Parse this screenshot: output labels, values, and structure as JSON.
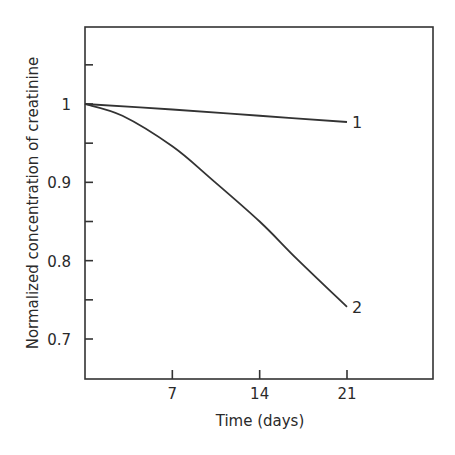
{
  "chart_data": {
    "type": "line",
    "title": "",
    "xlabel": "Time (days)",
    "ylabel": "Normalized concentration of creatinine",
    "xlim": [
      0,
      28
    ],
    "ylim": [
      0.65,
      1.1
    ],
    "x_ticks": [
      7,
      14,
      21
    ],
    "x_tick_labels": [
      "7",
      "14",
      "21"
    ],
    "y_ticks": [
      0.7,
      0.75,
      0.8,
      0.85,
      0.9,
      0.95,
      1.0,
      1.05
    ],
    "y_tick_labels": [
      "0.7",
      "",
      "0.8",
      "",
      "0.9",
      "",
      "1",
      ""
    ],
    "grid": false,
    "legend": "inline labels at line ends",
    "series": [
      {
        "name": "1",
        "x": [
          0,
          7,
          14,
          21
        ],
        "values": [
          1.0,
          0.993,
          0.985,
          0.977
        ]
      },
      {
        "name": "2",
        "x": [
          0,
          3,
          7,
          10,
          14,
          17,
          21
        ],
        "values": [
          1.0,
          0.985,
          0.946,
          0.906,
          0.85,
          0.802,
          0.741
        ]
      }
    ],
    "annotations": [
      {
        "text": "1",
        "x": 21,
        "y": 0.977
      },
      {
        "text": "2",
        "x": 21,
        "y": 0.741
      }
    ]
  },
  "labels": {
    "xlabel": "Time (days)",
    "ylabel": "Normalized concentration of creatinine",
    "series_1": "1",
    "series_2": "2"
  }
}
